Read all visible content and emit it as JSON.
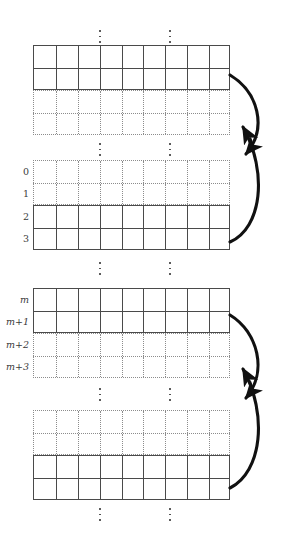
{
  "figure": {
    "type": "memory-layout-diagram",
    "title": "",
    "columns": 9,
    "block_count": 4,
    "colors": {
      "solid_line": "#4a4a4a",
      "dotted_line": "#8c8c8c",
      "arrow": "#111111",
      "label_text": "#3a3a3a",
      "background": "#ffffff"
    }
  },
  "ellipsis": {
    "glyph": "vertical-ellipsis",
    "dot_count": 3,
    "column_positions": [
      100,
      170
    ],
    "groups": [
      {
        "name": "top-ellipsis",
        "y": 30
      },
      {
        "name": "between-block1-block2",
        "y": 143
      },
      {
        "name": "between-block2-block3",
        "y": 262
      },
      {
        "name": "between-block3-block4",
        "y": 388
      },
      {
        "name": "bottom-ellipsis",
        "y": 508
      }
    ]
  },
  "blocks": [
    {
      "name": "block-1",
      "top": 45,
      "rows": [
        {
          "label": "",
          "style": "solid"
        },
        {
          "label": "",
          "style": "solid"
        },
        {
          "label": "",
          "style": "dotted"
        },
        {
          "label": "",
          "style": "dotted"
        }
      ]
    },
    {
      "name": "block-2",
      "top": 160,
      "rows": [
        {
          "label": "0",
          "style": "dotted",
          "italic": false
        },
        {
          "label": "1",
          "style": "dotted",
          "italic": false
        },
        {
          "label": "2",
          "style": "solid",
          "italic": false
        },
        {
          "label": "3",
          "style": "solid",
          "italic": false
        }
      ]
    },
    {
      "name": "block-3",
      "top": 288,
      "rows": [
        {
          "label": "m",
          "style": "solid",
          "italic": true
        },
        {
          "label": "m+1",
          "style": "solid",
          "italic": true
        },
        {
          "label": "m+2",
          "style": "dotted",
          "italic": true
        },
        {
          "label": "m+3",
          "style": "dotted",
          "italic": true
        }
      ]
    },
    {
      "name": "block-4",
      "top": 410,
      "rows": [
        {
          "label": "",
          "style": "dotted"
        },
        {
          "label": "",
          "style": "dotted"
        },
        {
          "label": "",
          "style": "solid"
        },
        {
          "label": "",
          "style": "solid"
        }
      ]
    }
  ],
  "arrows": [
    {
      "name": "arrow-upper-down",
      "description": "curve from block-1 right edge down to block-2 row 1",
      "from": "block-1",
      "to": "block-2",
      "direction": "down"
    },
    {
      "name": "arrow-upper-up",
      "description": "curve from block-2 right edge up to block-1 row 4",
      "from": "block-2",
      "to": "block-1",
      "direction": "up"
    },
    {
      "name": "arrow-lower-down",
      "description": "curve from block-3 right edge down to block-4 row 2",
      "from": "block-3",
      "to": "block-4",
      "direction": "down"
    },
    {
      "name": "arrow-lower-up",
      "description": "curve from block-4 right edge up to block-3 row 4",
      "from": "block-4",
      "to": "block-3",
      "direction": "up"
    }
  ]
}
